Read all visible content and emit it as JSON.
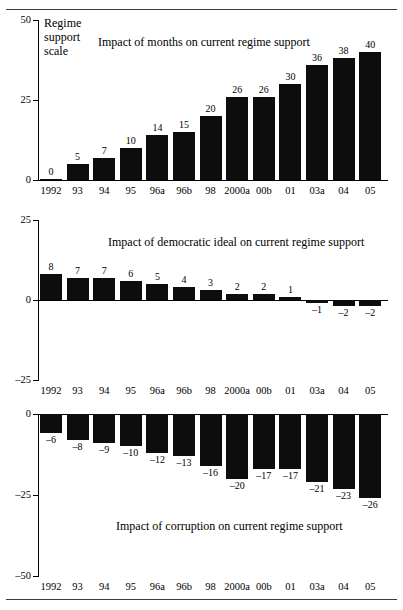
{
  "figure": {
    "y_axis_caption": "Regime\nsupport\nscale",
    "categories": [
      "1992",
      "93",
      "94",
      "95",
      "96a",
      "96b",
      "98",
      "2000a",
      "00b",
      "01",
      "03a",
      "04",
      "05"
    ],
    "bar_color": "#0d0d0d"
  },
  "chart_data": [
    {
      "type": "bar",
      "title": "Impact of months on current regime support",
      "xlabel": "",
      "ylabel": "Regime support scale",
      "categories": [
        "1992",
        "93",
        "94",
        "95",
        "96a",
        "96b",
        "98",
        "2000a",
        "00b",
        "01",
        "03a",
        "04",
        "05"
      ],
      "values": [
        0,
        5,
        7,
        10,
        14,
        15,
        20,
        26,
        26,
        30,
        36,
        38,
        40
      ],
      "value_labels": [
        "0",
        "5",
        "7",
        "10",
        "14",
        "15",
        "20",
        "26",
        "26",
        "30",
        "36",
        "38",
        "40"
      ],
      "ylim": [
        0,
        50
      ],
      "yticks": [
        0,
        25,
        50
      ],
      "ytick_labels": [
        "0",
        "25",
        "50"
      ],
      "grid": false,
      "legend": "none"
    },
    {
      "type": "bar",
      "title": "Impact of democratic ideal on current regime support",
      "xlabel": "",
      "ylabel": "",
      "categories": [
        "1992",
        "93",
        "94",
        "95",
        "96a",
        "96b",
        "98",
        "2000a",
        "00b",
        "01",
        "03a",
        "04",
        "05"
      ],
      "values": [
        8,
        7,
        7,
        6,
        5,
        4,
        3,
        2,
        2,
        1,
        -1,
        -2,
        -2
      ],
      "value_labels": [
        "8",
        "7",
        "7",
        "6",
        "5",
        "4",
        "3",
        "2",
        "2",
        "1",
        "–1",
        "–2",
        "–2"
      ],
      "ylim": [
        -25,
        25
      ],
      "yticks": [
        -25,
        0,
        25
      ],
      "ytick_labels": [
        "–25",
        "0",
        "25"
      ],
      "grid": false,
      "legend": "none"
    },
    {
      "type": "bar",
      "title": "Impact of corruption on current regime support",
      "xlabel": "",
      "ylabel": "",
      "categories": [
        "1992",
        "93",
        "94",
        "95",
        "96a",
        "96b",
        "98",
        "2000a",
        "00b",
        "01",
        "03a",
        "04",
        "05"
      ],
      "values": [
        -6,
        -8,
        -9,
        -10,
        -12,
        -13,
        -16,
        -20,
        -17,
        -17,
        -21,
        -23,
        -26
      ],
      "value_labels": [
        "–6",
        "–8",
        "–9",
        "–10",
        "–12",
        "–13",
        "–16",
        "–20",
        "–17",
        "–17",
        "–21",
        "–23",
        "–26"
      ],
      "ylim": [
        -50,
        0
      ],
      "yticks": [
        -50,
        -25,
        0
      ],
      "ytick_labels": [
        "–50",
        "–25",
        "0"
      ],
      "grid": false,
      "legend": "none"
    }
  ]
}
